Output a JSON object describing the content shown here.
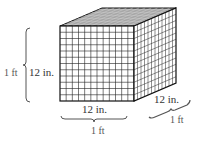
{
  "figure": {
    "grid_cells_per_edge": 12,
    "colors": {
      "edge": "#111111",
      "grid": "#222222",
      "top_fill": "#9a9a9a",
      "text": "#333333"
    }
  },
  "labels": {
    "height_inner": "12 in.",
    "height_outer": "1 ft",
    "width_inner": "12 in.",
    "width_outer": "1 ft",
    "depth_inner": "12 in.",
    "depth_outer": "1 ft"
  }
}
